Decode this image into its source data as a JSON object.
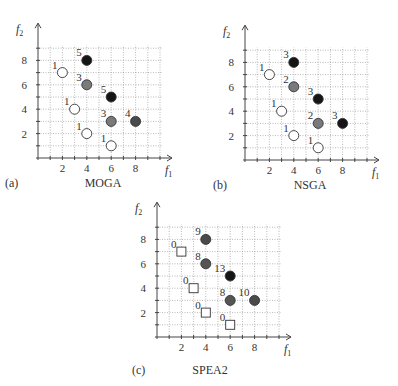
{
  "chart_data": [
    {
      "type": "scatter",
      "panel": "(a)",
      "title": "MOGA",
      "xlabel": "f1",
      "ylabel": "f2",
      "xticks": [
        2,
        4,
        6,
        8
      ],
      "yticks": [
        2,
        4,
        6,
        8
      ],
      "xlim": [
        0,
        10
      ],
      "ylim": [
        0,
        9
      ],
      "grid": true,
      "points": [
        {
          "x": 2,
          "y": 7,
          "label": "1",
          "fill": "#ffffff",
          "shape": "circle"
        },
        {
          "x": 3,
          "y": 4,
          "label": "1",
          "fill": "#ffffff",
          "shape": "circle"
        },
        {
          "x": 4,
          "y": 2,
          "label": "1",
          "fill": "#ffffff",
          "shape": "circle"
        },
        {
          "x": 6,
          "y": 1,
          "label": "1",
          "fill": "#ffffff",
          "shape": "circle"
        },
        {
          "x": 4,
          "y": 8,
          "label": "5",
          "fill": "#151515",
          "shape": "circle"
        },
        {
          "x": 4,
          "y": 6,
          "label": "3",
          "fill": "#7a7a7a",
          "shape": "circle"
        },
        {
          "x": 6,
          "y": 5,
          "label": "5",
          "fill": "#151515",
          "shape": "circle"
        },
        {
          "x": 6,
          "y": 3,
          "label": "3",
          "fill": "#7a7a7a",
          "shape": "circle"
        },
        {
          "x": 8,
          "y": 3,
          "label": "4",
          "fill": "#4a4a4a",
          "shape": "circle"
        }
      ]
    },
    {
      "type": "scatter",
      "panel": "(b)",
      "title": "NSGA",
      "xlabel": "f1",
      "ylabel": "f2",
      "xticks": [
        2,
        4,
        6,
        8
      ],
      "yticks": [
        2,
        4,
        6,
        8
      ],
      "xlim": [
        0,
        10
      ],
      "ylim": [
        0,
        9
      ],
      "grid": true,
      "points": [
        {
          "x": 2,
          "y": 7,
          "label": "1",
          "fill": "#ffffff",
          "shape": "circle"
        },
        {
          "x": 3,
          "y": 4,
          "label": "1",
          "fill": "#ffffff",
          "shape": "circle"
        },
        {
          "x": 4,
          "y": 2,
          "label": "1",
          "fill": "#ffffff",
          "shape": "circle"
        },
        {
          "x": 6,
          "y": 1,
          "label": "1",
          "fill": "#ffffff",
          "shape": "circle"
        },
        {
          "x": 4,
          "y": 8,
          "label": "3",
          "fill": "#151515",
          "shape": "circle"
        },
        {
          "x": 4,
          "y": 6,
          "label": "2",
          "fill": "#7a7a7a",
          "shape": "circle"
        },
        {
          "x": 6,
          "y": 5,
          "label": "3",
          "fill": "#151515",
          "shape": "circle"
        },
        {
          "x": 6,
          "y": 3,
          "label": "2",
          "fill": "#7a7a7a",
          "shape": "circle"
        },
        {
          "x": 8,
          "y": 3,
          "label": "3",
          "fill": "#151515",
          "shape": "circle"
        }
      ]
    },
    {
      "type": "scatter",
      "panel": "(c)",
      "title": "SPEA2",
      "xlabel": "f1",
      "ylabel": "f2",
      "xticks": [
        2,
        4,
        6,
        8
      ],
      "yticks": [
        2,
        4,
        6,
        8
      ],
      "xlim": [
        0,
        10
      ],
      "ylim": [
        0,
        9
      ],
      "grid": true,
      "points": [
        {
          "x": 2,
          "y": 7,
          "label": "0",
          "fill": "#ffffff",
          "shape": "square"
        },
        {
          "x": 3,
          "y": 4,
          "label": "0",
          "fill": "#ffffff",
          "shape": "square"
        },
        {
          "x": 4,
          "y": 2,
          "label": "0",
          "fill": "#ffffff",
          "shape": "square"
        },
        {
          "x": 6,
          "y": 1,
          "label": "0",
          "fill": "#ffffff",
          "shape": "square"
        },
        {
          "x": 4,
          "y": 8,
          "label": "9",
          "fill": "#4a4a4a",
          "shape": "circle"
        },
        {
          "x": 4,
          "y": 6,
          "label": "8",
          "fill": "#555555",
          "shape": "circle"
        },
        {
          "x": 6,
          "y": 5,
          "label": "13",
          "fill": "#151515",
          "shape": "circle"
        },
        {
          "x": 6,
          "y": 3,
          "label": "8",
          "fill": "#555555",
          "shape": "circle"
        },
        {
          "x": 8,
          "y": 3,
          "label": "10",
          "fill": "#4a4a4a",
          "shape": "circle"
        }
      ]
    }
  ],
  "panels": [
    {
      "id": "a",
      "panel_label": "(a)",
      "title": "MOGA",
      "ox": 38,
      "oy": 158,
      "cap_y": 187,
      "cap_x": 103,
      "tag_x": 5
    },
    {
      "id": "b",
      "panel_label": "(b)",
      "title": "NSGA",
      "ox": 245,
      "oy": 160,
      "cap_y": 189,
      "cap_x": 310,
      "tag_x": 213
    },
    {
      "id": "c",
      "panel_label": "(c)",
      "title": "SPEA2",
      "ox": 157,
      "oy": 337,
      "cap_y": 374,
      "cap_x": 210,
      "tag_x": 132
    }
  ],
  "axis_labels": {
    "x_main": "f",
    "x_sub": "1",
    "y_main": "f",
    "y_sub": "2"
  }
}
